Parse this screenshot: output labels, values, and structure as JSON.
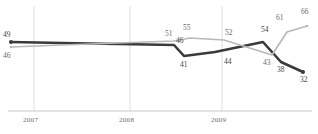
{
  "chart_data": {
    "type": "line",
    "title": "",
    "subtitle": "",
    "xlabel": "",
    "ylabel": "",
    "grid": "vertical-only",
    "legend": "none",
    "xlim": [
      0,
      15
    ],
    "ylim": [
      28,
      70
    ],
    "x_tick_labels": [
      "2007",
      "2008",
      "2009"
    ],
    "x_tick_positions": [
      34,
      130,
      222
    ],
    "axis_line_color": "#c9c9c9",
    "gridline_color": "#d9d9d9",
    "series": [
      {
        "name": "dark",
        "color": "#3a3a3a",
        "width": 2.6,
        "values": [
          49,
          49,
          46,
          41,
          44,
          54,
          38,
          32
        ],
        "x": [
          11,
          62,
          174,
          184,
          215,
          263,
          281,
          303
        ],
        "y": [
          42,
          43,
          45,
          56,
          52,
          42,
          62,
          72
        ],
        "labels": [
          "49",
          "",
          "46",
          "41",
          "44",
          "54",
          "38",
          "32"
        ]
      },
      {
        "name": "light",
        "color": "#b9b9b9",
        "width": 1.7,
        "values": [
          46,
          46,
          51,
          55,
          52,
          43,
          61,
          66
        ],
        "x": [
          11,
          62,
          174,
          190,
          224,
          272,
          287,
          307
        ],
        "y": [
          47,
          45,
          41,
          38,
          40,
          55,
          32,
          26
        ],
        "labels": [
          "46",
          "",
          "51",
          "55",
          "52",
          "43",
          "61",
          "66"
        ]
      }
    ],
    "point_labels": [
      {
        "text": "49",
        "x": 3,
        "y": 31,
        "series": "dark"
      },
      {
        "text": "46",
        "x": 3,
        "y": 52,
        "series": "light"
      },
      {
        "text": "51",
        "x": 165,
        "y": 30,
        "series": "light"
      },
      {
        "text": "55",
        "x": 183,
        "y": 24,
        "series": "light"
      },
      {
        "text": "46",
        "x": 176,
        "y": 37,
        "series": "dark"
      },
      {
        "text": "41",
        "x": 180,
        "y": 61,
        "series": "dark"
      },
      {
        "text": "52",
        "x": 225,
        "y": 29,
        "series": "light"
      },
      {
        "text": "44",
        "x": 224,
        "y": 58,
        "series": "dark"
      },
      {
        "text": "54",
        "x": 261,
        "y": 26,
        "series": "dark"
      },
      {
        "text": "43",
        "x": 263,
        "y": 59,
        "series": "light"
      },
      {
        "text": "61",
        "x": 276,
        "y": 14,
        "series": "light"
      },
      {
        "text": "38",
        "x": 277,
        "y": 66,
        "series": "dark"
      },
      {
        "text": "66",
        "x": 301,
        "y": 8,
        "series": "light"
      },
      {
        "text": "32",
        "x": 300,
        "y": 76,
        "series": "dark"
      }
    ],
    "x_axis": {
      "y_position": 111,
      "x_start": 8,
      "x_end": 312,
      "labels": [
        {
          "text": "2007",
          "x": 23,
          "y": 116
        },
        {
          "text": "2008",
          "x": 119,
          "y": 116
        },
        {
          "text": "2009",
          "x": 211,
          "y": 116
        }
      ]
    }
  }
}
